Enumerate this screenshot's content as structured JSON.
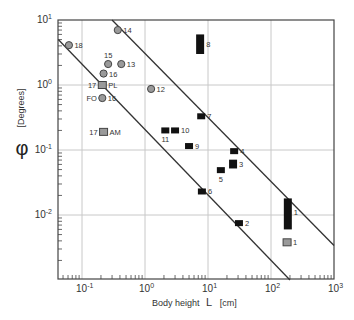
{
  "chart_data": {
    "type": "scatter",
    "title": "",
    "xlabel": "Body height L [cm]",
    "ylabel": "φ [Degrees]",
    "xscale": "log",
    "yscale": "log",
    "xlim": [
      0.042,
      1000
    ],
    "ylim": [
      0.001,
      10
    ],
    "grid": true,
    "x_ticks": [
      {
        "value": 0.1,
        "base": "10",
        "exp": "-1"
      },
      {
        "value": 1,
        "base": "10",
        "exp": "0"
      },
      {
        "value": 10,
        "base": "10",
        "exp": "1"
      },
      {
        "value": 100,
        "base": "10",
        "exp": "2"
      },
      {
        "value": 1000,
        "base": "10",
        "exp": "3"
      }
    ],
    "y_ticks": [
      {
        "value": 10,
        "base": "10",
        "exp": "1"
      },
      {
        "value": 1,
        "base": "10",
        "exp": "0"
      },
      {
        "value": 0.1,
        "base": "10",
        "exp": "-1"
      },
      {
        "value": 0.01,
        "base": "10",
        "exp": "-2"
      }
    ],
    "series": [
      {
        "name": "circles",
        "marker": "circle",
        "color": "#9a9a9a",
        "points": [
          {
            "label": "14",
            "x": 0.37,
            "y": 7.0,
            "label_pos": "right"
          },
          {
            "label": "18",
            "x": 0.062,
            "y": 4.1,
            "label_pos": "right"
          },
          {
            "label": "15",
            "x": 0.26,
            "y": 2.1,
            "label_pos": "above"
          },
          {
            "label": "13",
            "x": 0.42,
            "y": 2.1,
            "label_pos": "right"
          },
          {
            "label": "16",
            "x": 0.22,
            "y": 1.5,
            "label_pos": "right"
          },
          {
            "label": "FO 16",
            "x": 0.21,
            "y": 0.63,
            "label_pos": "both"
          },
          {
            "label": "12",
            "x": 1.25,
            "y": 0.87,
            "label_pos": "right"
          }
        ]
      },
      {
        "name": "gray squares",
        "marker": "square",
        "color": "#9a9a9a",
        "points": [
          {
            "label": "17 PL",
            "x": 0.21,
            "y": 1.0,
            "label_pos": "both"
          },
          {
            "label": "17 AM",
            "x": 0.22,
            "y": 0.19,
            "label_pos": "both"
          },
          {
            "label": "1",
            "x": 180,
            "y": 0.0038,
            "label_pos": "right"
          }
        ]
      },
      {
        "name": "black rectangles",
        "marker": "rect",
        "color": "#111111",
        "points": [
          {
            "label": "11",
            "x": 2.1,
            "y": 0.2,
            "label_pos": "below"
          },
          {
            "label": "10",
            "x": 3.0,
            "y": 0.2,
            "label_pos": "right"
          },
          {
            "label": "9",
            "x": 5.0,
            "y": 0.115,
            "label_pos": "right"
          },
          {
            "label": "7",
            "x": 7.8,
            "y": 0.33,
            "label_pos": "right"
          },
          {
            "label": "8",
            "x": 7.5,
            "y": 4.3,
            "y_range": [
              3.0,
              6.0
            ],
            "label_pos": "right"
          },
          {
            "label": "6",
            "x": 8.0,
            "y": 0.023,
            "label_pos": "right"
          },
          {
            "label": "4",
            "x": 26,
            "y": 0.096,
            "label_pos": "right"
          },
          {
            "label": "3",
            "x": 25,
            "y": 0.061,
            "y_range": [
              0.052,
              0.071
            ],
            "label_pos": "right"
          },
          {
            "label": "5",
            "x": 16,
            "y": 0.049,
            "label_pos": "below"
          },
          {
            "label": "2",
            "x": 31,
            "y": 0.0075,
            "label_pos": "right"
          },
          {
            "label": "1",
            "x": 185,
            "y": 0.011,
            "y_range": [
              0.006,
              0.018
            ],
            "label_pos": "right"
          }
        ]
      }
    ],
    "lines": [
      {
        "name": "upper limit line",
        "from": {
          "x": 0.3,
          "y": 10
        },
        "to": {
          "x": 1000,
          "y": 0.0034
        }
      },
      {
        "name": "lower limit line",
        "from": {
          "x": 0.042,
          "y": 5.0
        },
        "to": {
          "x": 200,
          "y": 0.001
        }
      }
    ]
  },
  "axes": {
    "x_title": "Body height",
    "x_symbol": "L",
    "x_unit": "[cm]",
    "y_symbol": "φ",
    "y_unit": "[Degrees]"
  }
}
